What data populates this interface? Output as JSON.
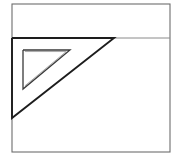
{
  "figure": {
    "kind": "line-drawing",
    "background_color": "#ffffff",
    "canvas": {
      "width": 182,
      "height": 159
    },
    "frame": {
      "name": "outer rectangle",
      "x": 12,
      "y": 4,
      "width": 158,
      "height": 148,
      "stroke_color": "#6d6d6d",
      "stroke_width": 1.1
    },
    "horizontal_rule": {
      "name": "horizontal rule line",
      "x1": 113,
      "y1": 38,
      "x2": 170,
      "y2": 38,
      "stroke_color": "#8a8a8a",
      "stroke_width": 1
    },
    "set_square": {
      "name": "large right triangle",
      "points": "12,38 114,38 12,118",
      "vertices": [
        {
          "label": "top-left",
          "x": 12,
          "y": 38
        },
        {
          "label": "top-right apex",
          "x": 114,
          "y": 38
        },
        {
          "label": "bottom-left",
          "x": 12,
          "y": 118
        }
      ],
      "stroke_color": "#1d1d1d",
      "stroke_width": 1.9
    },
    "cutout": {
      "name": "inner triangular cutout",
      "points": "23,50 70,50 23,89",
      "vertices": [
        {
          "label": "top-left",
          "x": 23,
          "y": 50
        },
        {
          "label": "top-right",
          "x": 70,
          "y": 50
        },
        {
          "label": "bottom-left",
          "x": 23,
          "y": 89
        }
      ],
      "stroke_color": "#3a3a3a",
      "stroke_width": 1.3,
      "inner_shadow_color": "#a9a9a9"
    }
  },
  "accessibility": {
    "alt_text": "Simple black and white line drawing: a rectangular frame containing a large right-angled drafting triangle whose top edge lies along a horizontal line; a smaller triangular hole is cut out of its interior."
  }
}
